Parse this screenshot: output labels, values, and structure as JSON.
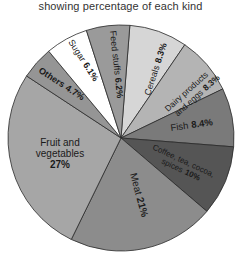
{
  "title": "showing percentage of each kind",
  "chart_data": {
    "type": "pie",
    "title": "showing percentage of each kind",
    "start_angle_deg": 4.5,
    "direction": "clockwise",
    "slices": [
      {
        "label": "Cereals",
        "value": 8.3,
        "display": "Cereals 8.3%",
        "color": "#d6d6d6"
      },
      {
        "label": "Dairy products and eggs",
        "value": 8.3,
        "display": "Dairy products and eggs 8.3%",
        "color": "#b4b4b4"
      },
      {
        "label": "Fish",
        "value": 8.4,
        "display": "Fish 8.4%",
        "color": "#7a7a7a"
      },
      {
        "label": "Coffee, tea, cocoa, spices",
        "value": 10,
        "display": "Coffee, tea, cocoa, spices 10%",
        "color": "#555555"
      },
      {
        "label": "Meat",
        "value": 21,
        "display": "Meat 21%",
        "color": "#8c8c8c"
      },
      {
        "label": "Fruit and vegetables",
        "value": 27,
        "display": "Fruit and vegetables 27%",
        "color": "#a6a6a6"
      },
      {
        "label": "Others",
        "value": 4.7,
        "display": "Others 4.7%",
        "color": "#959595"
      },
      {
        "label": "Sugar",
        "value": 6.1,
        "display": "Sugar 6.1%",
        "color": "#ffffff"
      },
      {
        "label": "Feed stuffs",
        "value": 6.2,
        "display": "Feed stuffs 6.2%",
        "color": "#9a9a9a"
      }
    ],
    "legend": "none (labels inside slices)"
  },
  "labels": {
    "cereals": {
      "name": "Cereals",
      "pct": "8.3%"
    },
    "dairy": {
      "line1": "Dairy products",
      "line2": "and eggs",
      "pct": "8.3%"
    },
    "fish": {
      "name": "Fish",
      "pct": "8.4%"
    },
    "coffee": {
      "line1": "Coffee, tea, cocoa,",
      "line2": "spices",
      "pct": "10%"
    },
    "meat": {
      "name": "Meat",
      "pct": "21%"
    },
    "fruit": {
      "line1": "Fruit and",
      "line2": "vegetables",
      "pct": "27%"
    },
    "others": {
      "name": "Others",
      "pct": "4.7%"
    },
    "sugar": {
      "name": "Sugar",
      "pct": "6.1%"
    },
    "feed": {
      "name": "Feed stuffs",
      "pct": "6.2%"
    }
  }
}
